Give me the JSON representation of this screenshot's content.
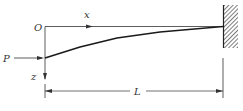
{
  "diagram": {
    "type": "cantilever-beam",
    "labels": {
      "origin": "O",
      "x_axis": "x",
      "z_axis": "z",
      "load": "P",
      "length": "L"
    },
    "caption": "",
    "colors": {
      "line": "#222222",
      "hatch": "#444444",
      "text": "#333333",
      "background": "#ffffff"
    }
  }
}
